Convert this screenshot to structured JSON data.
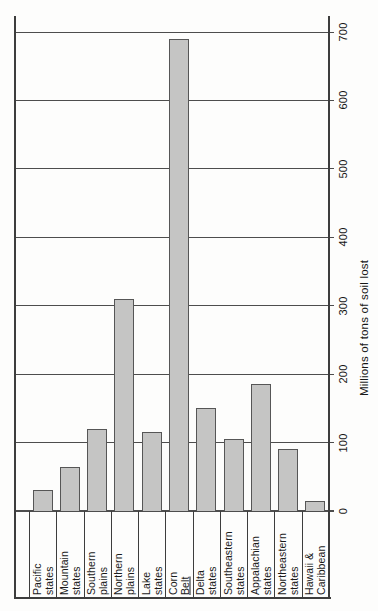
{
  "chart_data": {
    "type": "bar",
    "orientation": "rotated_90_ccw",
    "ylabel": "Millions of tons of soil lost",
    "ylim": [
      0,
      700
    ],
    "yticks": [
      0,
      100,
      200,
      300,
      400,
      500,
      600,
      700
    ],
    "grid": true,
    "legend": "none",
    "categories": [
      "Pacific states",
      "Mountain states",
      "Southern plains",
      "Northern plains",
      "Lake states",
      "Corn Belt",
      "Delta states",
      "Southeastern states",
      "Appalachian states",
      "Northeastern states",
      "Hawaii & Caribbean"
    ],
    "category_label_lines": [
      [
        "Pacific",
        "states"
      ],
      [
        "Mountain",
        "states"
      ],
      [
        "Southern",
        "plains"
      ],
      [
        "Northern",
        "plains"
      ],
      [
        "Lake",
        "states"
      ],
      [
        "Corn",
        "Belt"
      ],
      [
        "Delta",
        "states"
      ],
      [
        "Southeastern",
        "states"
      ],
      [
        "Appalachian",
        "states"
      ],
      [
        "Northeastern",
        "states"
      ],
      [
        "Hawaii &",
        "Caribbean"
      ]
    ],
    "underlined_words": [
      "Belt"
    ],
    "values": [
      30,
      65,
      120,
      310,
      115,
      690,
      150,
      105,
      185,
      90,
      15
    ]
  },
  "colors": {
    "paper": "#fdfdfc",
    "bar_fill": "#c5c5c4",
    "bar_border": "#565656",
    "axis_line": "#3d3d3d",
    "gridline": "#4d4d4d",
    "text": "#1a1a1a"
  }
}
